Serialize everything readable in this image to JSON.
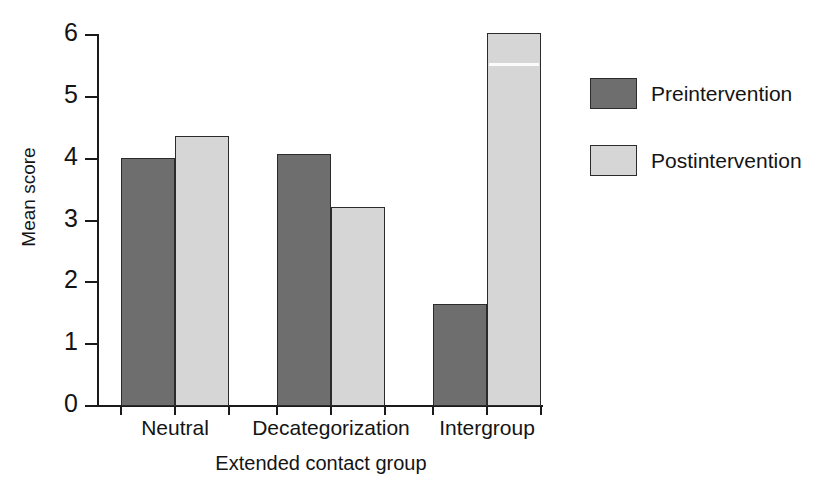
{
  "chart_data": {
    "type": "bar",
    "title": "",
    "subtitle": "",
    "xlabel": "Extended contact group",
    "ylabel": "Mean score",
    "categories": [
      "Neutral",
      "Decategorization",
      "Intergroup"
    ],
    "series": [
      {
        "name": "Preintervention",
        "color": "#6e6e6e",
        "values": [
          4.01,
          4.07,
          1.65
        ]
      },
      {
        "name": "Postintervention",
        "color": "#d6d6d6",
        "values": [
          4.37,
          3.22,
          6.03
        ]
      }
    ],
    "ylim": [
      0,
      6
    ],
    "yticks": [
      0,
      1,
      2,
      3,
      4,
      5,
      6
    ],
    "ytick_labels": [
      "0",
      "1",
      "2",
      "3",
      "4",
      "5",
      "6"
    ],
    "grid": false,
    "legend_position": "right",
    "legend_entries": [
      "Preintervention",
      "Postintervention"
    ]
  },
  "colors": {
    "preintervention": "#6e6e6e",
    "postintervention": "#d6d6d6",
    "axis": "#1a1a1a",
    "text": "#141414",
    "background": "#ffffff"
  }
}
